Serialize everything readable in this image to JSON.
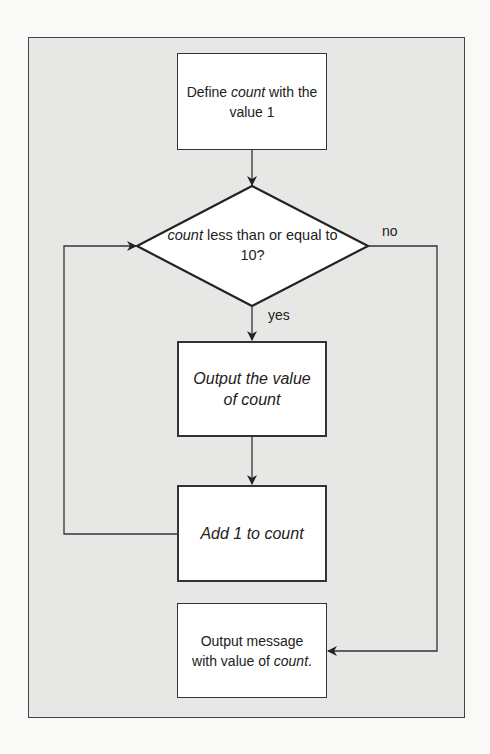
{
  "figure": {
    "title": "",
    "frame_background": "#e7e7e5",
    "line_color": "#333333"
  },
  "nodes": {
    "start": {
      "type": "process",
      "text_pre": "Define ",
      "text_italic": "count",
      "text_post": " with the value 1"
    },
    "decision": {
      "type": "decision",
      "text_italic": "count",
      "text_post": " less than or equal to 10?"
    },
    "output_value": {
      "type": "process",
      "text": "Output the value of count"
    },
    "increment": {
      "type": "process",
      "text": "Add 1 to count"
    },
    "output_message": {
      "type": "process",
      "text_pre": "Output message with value of ",
      "text_italic": "count",
      "text_post": "."
    }
  },
  "edges": [
    {
      "from": "start",
      "to": "decision",
      "label": ""
    },
    {
      "from": "decision",
      "to": "output_value",
      "label": "yes"
    },
    {
      "from": "output_value",
      "to": "increment",
      "label": ""
    },
    {
      "from": "increment",
      "to": "decision",
      "label": ""
    },
    {
      "from": "decision",
      "to": "output_message",
      "label": "no"
    }
  ],
  "labels": {
    "yes": "yes",
    "no": "no"
  }
}
